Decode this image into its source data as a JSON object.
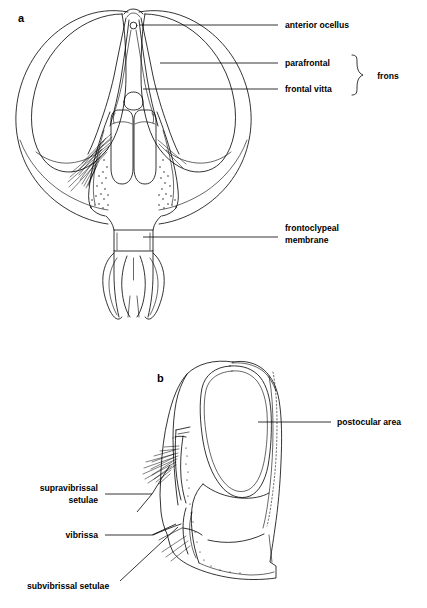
{
  "figure": {
    "type": "scientific-illustration",
    "background_color": "#ffffff",
    "ink_color": "#000000",
    "width": 427,
    "height": 608
  },
  "panels": [
    {
      "id": "a",
      "letter": "a",
      "view": "anterior head view",
      "letter_x": 18,
      "letter_y": 22
    },
    {
      "id": "b",
      "letter": "b",
      "view": "lateral head view",
      "letter_x": 157,
      "letter_y": 382
    }
  ],
  "annotations_panel_a": [
    {
      "id": "anterior-ocellus",
      "label": "anterior ocellus",
      "lines": [
        "anterior ocellus"
      ],
      "text_x": 285,
      "text_y": 28,
      "align": "start",
      "leader": {
        "x1": 140,
        "y1": 25,
        "x2": 278,
        "y2": 25
      }
    },
    {
      "id": "parafrontal",
      "label": "parafrontal",
      "lines": [
        "parafrontal"
      ],
      "text_x": 285,
      "text_y": 66,
      "align": "start",
      "leader": {
        "x1": 160,
        "y1": 63,
        "x2": 278,
        "y2": 63
      }
    },
    {
      "id": "frontal-vitta",
      "label": "frontal vitta",
      "lines": [
        "frontal vitta"
      ],
      "text_x": 285,
      "text_y": 92,
      "align": "start",
      "leader": {
        "x1": 143,
        "y1": 89,
        "x2": 278,
        "y2": 89
      }
    },
    {
      "id": "frontoclypeal-membrane",
      "label": "frontoclypeal membrane",
      "lines": [
        "frontoclypeal",
        "membrane"
      ],
      "text_x": 285,
      "text_y": 231,
      "align": "start",
      "leader": {
        "x1": 143,
        "y1": 237,
        "x2": 278,
        "y2": 237
      }
    }
  ],
  "group_label_panel_a": {
    "id": "frons",
    "label": "frons",
    "text_x": 388,
    "text_y": 79,
    "members": [
      "parafrontal",
      "frontal vitta"
    ],
    "brace": {
      "x": 352,
      "top": 55,
      "bottom": 95,
      "mid": 75,
      "tip": 363
    }
  },
  "annotations_panel_b": [
    {
      "id": "postocular-area",
      "label": "postocular area",
      "lines": [
        "postocular area"
      ],
      "text_x": 337,
      "text_y": 425,
      "align": "start",
      "leader": {
        "x1": 258,
        "y1": 422,
        "x2": 331,
        "y2": 422
      }
    },
    {
      "id": "supravibrissal-setulae",
      "label": "supravibrissal setulae",
      "lines": [
        "supravibrissal",
        "setulae"
      ],
      "text_x": 98,
      "text_y": 491,
      "align": "end",
      "leader": {
        "x1": 105,
        "y1": 494,
        "x2": 152,
        "y2": 494
      }
    },
    {
      "id": "vibrissa",
      "label": "vibrissa",
      "lines": [
        "vibrissa"
      ],
      "text_x": 98,
      "text_y": 538,
      "align": "end",
      "leader": {
        "x1": 105,
        "y1": 535,
        "x2": 152,
        "y2": 528
      }
    },
    {
      "id": "subvibrissal-setulae",
      "label": "subvibrissal setulae",
      "lines": [
        "subvibrissal setulae"
      ],
      "text_x": 27,
      "text_y": 589,
      "align": "start",
      "leader": {
        "x1": 120,
        "y1": 580,
        "x2": 160,
        "y2": 533
      }
    }
  ]
}
